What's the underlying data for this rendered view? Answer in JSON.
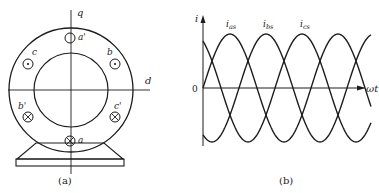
{
  "figure_a": {
    "caption": "(a)",
    "axes": {
      "q_label": "q",
      "d_label": "d"
    },
    "conductors": [
      {
        "label": "a'",
        "type": "empty",
        "x": 70,
        "y": 38
      },
      {
        "label": "b",
        "type": "dot",
        "x": 115,
        "y": 65
      },
      {
        "label": "c",
        "type": "dot",
        "x": 28,
        "y": 65
      },
      {
        "label": "b'",
        "type": "cross",
        "x": 28,
        "y": 117
      },
      {
        "label": "c'",
        "type": "cross",
        "x": 115,
        "y": 117
      },
      {
        "label": "a",
        "type": "cross",
        "x": 70,
        "y": 141
      }
    ]
  },
  "figure_b": {
    "caption": "(b)",
    "y_axis_label": "i",
    "x_axis_label": "ωt",
    "origin_label": "0",
    "series_labels": [
      "i_as",
      "i_bs",
      "i_cs"
    ]
  },
  "chart_data": {
    "type": "line",
    "title": "",
    "xlabel": "ωt",
    "ylabel": "i",
    "series": [
      {
        "name": "i_as",
        "function": "sin(ωt)",
        "phase_deg": 0
      },
      {
        "name": "i_bs",
        "function": "sin(ωt - 120°)",
        "phase_deg": -120
      },
      {
        "name": "i_cs",
        "function": "sin(ωt + 120°)",
        "phase_deg": 120
      }
    ],
    "x_range_deg": [
      0,
      560
    ],
    "ylim": [
      -1,
      1
    ],
    "grid": false,
    "legend": "inline labels above peaks"
  }
}
